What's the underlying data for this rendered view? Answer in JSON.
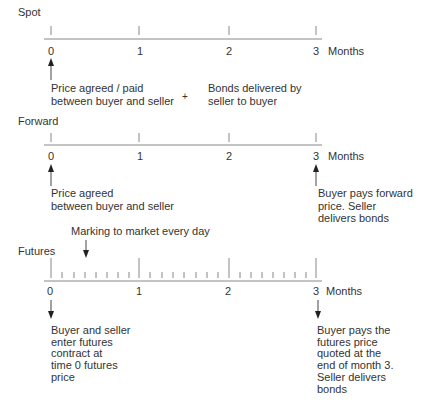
{
  "spot": {
    "label": "Spot",
    "ticks": [
      "0",
      "1",
      "2",
      "3"
    ],
    "unit": "Months",
    "note_left": [
      "Price agreed / paid",
      "between buyer and seller"
    ],
    "plus": "+",
    "note_right": [
      "Bonds delivered by",
      "seller to buyer"
    ]
  },
  "forward": {
    "label": "Forward",
    "ticks": [
      "0",
      "1",
      "2",
      "3"
    ],
    "unit": "Months",
    "note_left": [
      "Price agreed",
      "between buyer and seller"
    ],
    "note_right": [
      "Buyer pays forward",
      "price. Seller",
      "delivers bonds"
    ]
  },
  "futures": {
    "label": "Futures",
    "marking_note": "Marking to market every day",
    "ticks": [
      "0",
      "1",
      "2",
      "3"
    ],
    "unit": "Months",
    "note_left": [
      "Buyer and seller",
      "enter futures",
      "contract at",
      "time 0 futures",
      "price"
    ],
    "note_right": [
      "Buyer pays the",
      "futures price",
      "quoted at the",
      "end of month 3.",
      "Seller delivers",
      "bonds"
    ]
  },
  "colors": {
    "line": "#888888",
    "text": "#333333",
    "arrow": "#222222"
  }
}
